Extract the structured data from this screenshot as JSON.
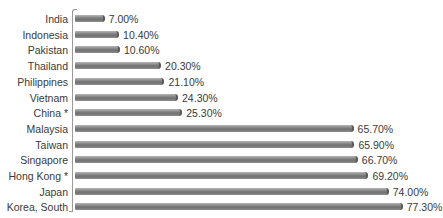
{
  "chart_data": {
    "type": "bar",
    "orientation": "horizontal",
    "title": "",
    "xlabel": "",
    "ylabel": "",
    "categories": [
      "India",
      "Indonesia",
      "Pakistan",
      "Thailand",
      "Philippines",
      "Vietnam",
      "China *",
      "Malaysia",
      "Taiwan",
      "Singapore",
      "Hong Kong *",
      "Japan",
      "Korea, South"
    ],
    "values": [
      7.0,
      10.4,
      10.6,
      20.3,
      21.1,
      24.3,
      25.3,
      65.7,
      65.9,
      66.7,
      69.2,
      74.0,
      77.3
    ],
    "value_labels": [
      "7.00%",
      "10.40%",
      "10.60%",
      "20.30%",
      "21.10%",
      "24.30%",
      "25.30%",
      "65.70%",
      "65.90%",
      "66.70%",
      "69.20%",
      "74.00%",
      "77.30%"
    ],
    "unit": "%",
    "xlim": [
      0,
      80
    ],
    "grid": false,
    "legend": null,
    "bar_color": "#808080"
  }
}
